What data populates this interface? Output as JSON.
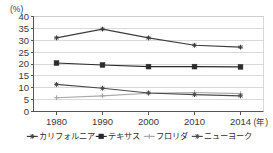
{
  "chart_data": {
    "type": "line",
    "title": "",
    "xlabel": "年",
    "ylabel": "(%)",
    "yunit": "(%)",
    "xunit": "(年)",
    "categories": [
      "1980",
      "1990",
      "2000",
      "2010",
      "2014"
    ],
    "x": [
      1980,
      1990,
      2000,
      2010,
      2014
    ],
    "ylim": [
      0,
      40
    ],
    "yticks": [
      0,
      5,
      10,
      15,
      20,
      25,
      30,
      35,
      40
    ],
    "ytick_labels": [
      "0",
      "5",
      "10",
      "15",
      "20",
      "25",
      "30",
      "35",
      "40"
    ],
    "grid": true,
    "legend_position": "bottom",
    "series": [
      {
        "name": "カリフォルニア",
        "marker": "cross",
        "color": "#3d3d3d",
        "values": [
          31.0,
          34.7,
          31.0,
          27.9,
          27.1
        ]
      },
      {
        "name": "テキサス",
        "marker": "square",
        "color": "#2b2b2b",
        "values": [
          20.4,
          19.6,
          18.9,
          18.9,
          18.8
        ]
      },
      {
        "name": "フロリダ",
        "marker": "plus",
        "color": "#a8a8a8",
        "values": [
          5.8,
          6.6,
          7.7,
          8.0,
          7.5
        ]
      },
      {
        "name": "ニューヨーク",
        "marker": "cross",
        "color": "#4a4a4a",
        "values": [
          11.4,
          9.8,
          7.8,
          7.1,
          6.6
        ]
      }
    ]
  }
}
